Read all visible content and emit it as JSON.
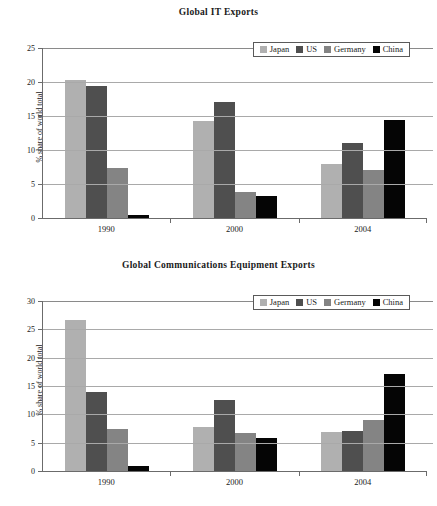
{
  "colors": {
    "japan": "#b0b0b0",
    "us": "#4f4f4f",
    "germany": "#848484",
    "china": "#050505",
    "axis": "#6b6b6b",
    "grid": "#a9a9a9",
    "text": "#1a1a1a",
    "background": "#ffffff"
  },
  "legend": {
    "items": [
      {
        "label": "Japan",
        "swatch": "legend-swatch-japan"
      },
      {
        "label": "US",
        "swatch": "legend-swatch-us"
      },
      {
        "label": "Germany",
        "swatch": "legend-swatch-germany"
      },
      {
        "label": "China",
        "swatch": "legend-swatch-china"
      }
    ]
  },
  "chart_data": [
    {
      "type": "bar",
      "title": "Global IT Exports",
      "xlabel": "",
      "ylabel": "% share of world total",
      "categories": [
        "1990",
        "2000",
        "2004"
      ],
      "ylim": [
        0,
        25
      ],
      "yticks": [
        0,
        5,
        10,
        15,
        20,
        25
      ],
      "ytick_labels": [
        "0",
        "5",
        "10",
        "15",
        "20",
        "25"
      ],
      "grid": true,
      "legend_position": "top-right",
      "series": [
        {
          "name": "Japan",
          "values": [
            20.3,
            14.2,
            8.0
          ]
        },
        {
          "name": "US",
          "values": [
            19.4,
            17.0,
            11.1
          ]
        },
        {
          "name": "Germany",
          "values": [
            7.4,
            3.8,
            7.0
          ]
        },
        {
          "name": "China",
          "values": [
            0.4,
            3.3,
            14.4
          ]
        }
      ]
    },
    {
      "type": "bar",
      "title": "Global Communications Equipment Exports",
      "xlabel": "",
      "ylabel": "% share of world total",
      "categories": [
        "1990",
        "2000",
        "2004"
      ],
      "ylim": [
        0,
        30
      ],
      "yticks": [
        0,
        5,
        10,
        15,
        20,
        25,
        30
      ],
      "ytick_labels": [
        "0",
        "5",
        "10",
        "15",
        "20",
        "25",
        "30"
      ],
      "grid": true,
      "legend_position": "top-right",
      "series": [
        {
          "name": "Japan",
          "values": [
            26.7,
            7.8,
            6.9
          ]
        },
        {
          "name": "US",
          "values": [
            13.9,
            12.5,
            7.1
          ]
        },
        {
          "name": "Germany",
          "values": [
            7.5,
            6.7,
            9.0
          ]
        },
        {
          "name": "China",
          "values": [
            0.8,
            5.9,
            17.2
          ]
        }
      ]
    }
  ]
}
